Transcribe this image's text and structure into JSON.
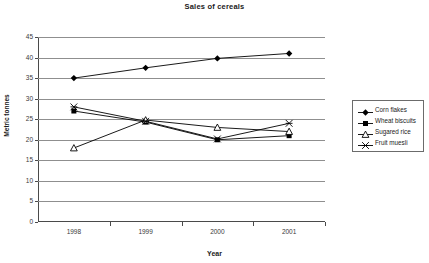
{
  "chart_data": {
    "type": "line",
    "title": "Sales of cereals",
    "xlabel": "Year",
    "ylabel": "Metric tonnes",
    "categories": [
      "1998",
      "1999",
      "2000",
      "2001"
    ],
    "x": [
      1998,
      1999,
      2000,
      2001
    ],
    "ylim": [
      0,
      45
    ],
    "yticks": [
      "0",
      "5",
      "10",
      "15",
      "20",
      "25",
      "30",
      "35",
      "40",
      "45"
    ],
    "ytick_values": [
      0,
      5,
      10,
      15,
      20,
      25,
      30,
      35,
      40,
      45
    ],
    "grid": true,
    "legend_position": "right",
    "series": [
      {
        "name": "Corn flakes",
        "marker": "diamond",
        "color": "#000000",
        "values": [
          35.0,
          37.5,
          39.8,
          41.0
        ]
      },
      {
        "name": "Wheat biscuits",
        "marker": "square",
        "color": "#000000",
        "values": [
          27.0,
          24.3,
          20.0,
          21.0
        ]
      },
      {
        "name": "Sugared rice",
        "marker": "triangle",
        "color": "#000000",
        "values": [
          18.0,
          24.8,
          23.0,
          22.0
        ]
      },
      {
        "name": "Fruit muesli",
        "marker": "star",
        "color": "#000000",
        "values": [
          28.0,
          24.5,
          20.2,
          24.0
        ]
      }
    ]
  },
  "legend": {
    "items": [
      {
        "label": "Corn flakes",
        "marker": "diamond"
      },
      {
        "label": "Wheat biscuits",
        "marker": "square"
      },
      {
        "label": "Sugared rice",
        "marker": "triangle"
      },
      {
        "label": "Fruit muesli",
        "marker": "star"
      }
    ]
  }
}
